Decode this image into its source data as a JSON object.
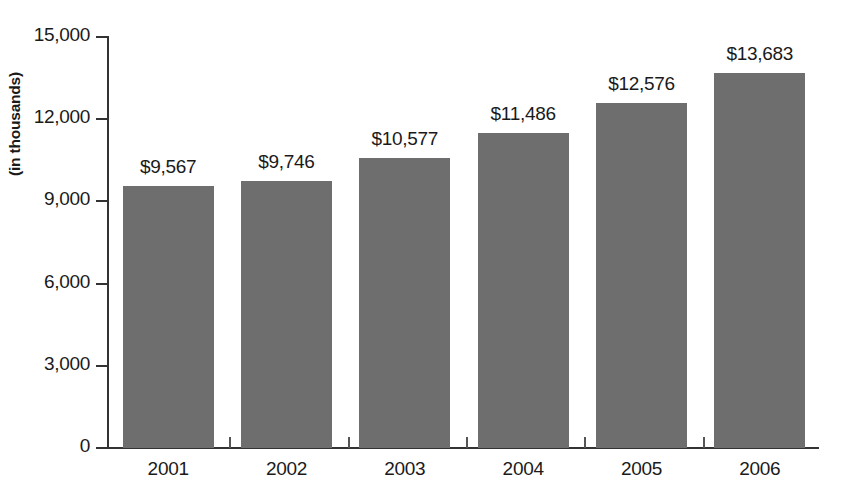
{
  "chart_data": {
    "type": "bar",
    "title": "",
    "subtitle": "",
    "xlabel": "",
    "ylabel": "(in thousands)",
    "categories": [
      "2001",
      "2002",
      "2003",
      "2004",
      "2005",
      "2006"
    ],
    "values": [
      9567,
      9746,
      10577,
      11486,
      12576,
      13683
    ],
    "value_labels": [
      "$9,567",
      "$9,746",
      "$10,577",
      "$11,486",
      "$12,576",
      "$13,683"
    ],
    "ylim": [
      0,
      15000
    ],
    "ytick_values": [
      0,
      3000,
      6000,
      9000,
      12000,
      15000
    ],
    "ytick_labels": [
      "0",
      "3,000",
      "6,000",
      "9,000",
      "12,000",
      "15,000"
    ],
    "grid": false,
    "legend": null,
    "series": [
      {
        "name": "",
        "values": [
          9567,
          9746,
          10577,
          11486,
          12576,
          13683
        ],
        "color": "#6e6e6e"
      }
    ],
    "colors": {
      "bar": "#6e6e6e",
      "axis": "#333333",
      "text": "#1a1a1a",
      "background": "#ffffff"
    }
  }
}
